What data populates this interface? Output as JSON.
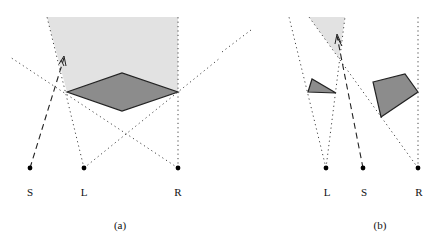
{
  "panels": [
    {
      "id": "a",
      "caption": "(a)",
      "points": [
        {
          "label": "S",
          "x": 30,
          "y": 168
        },
        {
          "label": "L",
          "x": 84,
          "y": 168
        },
        {
          "label": "R",
          "x": 178,
          "y": 168
        }
      ]
    },
    {
      "id": "b",
      "caption": "(b)",
      "points": [
        {
          "label": "L",
          "x": 326,
          "y": 168
        },
        {
          "label": "S",
          "x": 363,
          "y": 168
        },
        {
          "label": "R",
          "x": 418,
          "y": 168
        }
      ]
    }
  ],
  "colors": {
    "shadow_region": "#e2e2e2",
    "obstacle_fill": "#8c8c8c",
    "stroke": "#222222"
  }
}
